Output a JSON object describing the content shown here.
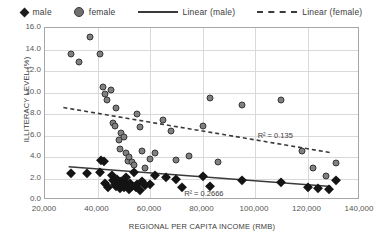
{
  "chart_data": {
    "type": "scatter",
    "title": "",
    "xlabel": "REGIONAL PER CAPITA INCOME (RMB)",
    "ylabel": "ILLITERACY LEVEL (%)",
    "xlim": [
      20000,
      140000
    ],
    "ylim": [
      0.0,
      16.0
    ],
    "xticks": [
      "20,000",
      "40,000",
      "60,000",
      "80,000",
      "100,000",
      "120,000",
      "140,000"
    ],
    "xtick_values": [
      20000,
      40000,
      60000,
      80000,
      100000,
      120000,
      140000
    ],
    "yticks": [
      "0.0",
      "2.0",
      "4.0",
      "6.0",
      "8.0",
      "10.0",
      "12.0",
      "14.0",
      "16.0"
    ],
    "ytick_values": [
      0,
      2,
      4,
      6,
      8,
      10,
      12,
      14,
      16
    ],
    "grid": "both",
    "legend_position": "top",
    "legend": [
      {
        "label": "male",
        "marker": "diamond",
        "color": "#141414"
      },
      {
        "label": "female",
        "marker": "circle",
        "color": "#808080"
      },
      {
        "label": "Linear (male)",
        "marker": "solid-line",
        "color": "#3a3a3a"
      },
      {
        "label": "Linear (female)",
        "marker": "dashed-line",
        "color": "#3a3a3a"
      }
    ],
    "series": [
      {
        "name": "male",
        "marker": "diamond",
        "points": [
          [
            30000,
            2.5
          ],
          [
            36000,
            2.5
          ],
          [
            41000,
            2.6
          ],
          [
            41500,
            3.7
          ],
          [
            42500,
            3.6
          ],
          [
            43000,
            1.6
          ],
          [
            44000,
            1.2
          ],
          [
            45500,
            2.3
          ],
          [
            46000,
            1.9
          ],
          [
            46500,
            1.5
          ],
          [
            47000,
            1.3
          ],
          [
            47500,
            2.0
          ],
          [
            48000,
            1.4
          ],
          [
            48500,
            1.1
          ],
          [
            49000,
            1.8
          ],
          [
            49500,
            1.5
          ],
          [
            50000,
            1.2
          ],
          [
            50500,
            1.7
          ],
          [
            51000,
            2.1
          ],
          [
            51500,
            1.4
          ],
          [
            52000,
            1.0
          ],
          [
            52500,
            1.6
          ],
          [
            53000,
            1.3
          ],
          [
            54000,
            2.6
          ],
          [
            54500,
            1.2
          ],
          [
            55000,
            1.5
          ],
          [
            56000,
            0.9
          ],
          [
            57000,
            1.8
          ],
          [
            58000,
            1.4
          ],
          [
            60000,
            1.5
          ],
          [
            62000,
            2.3
          ],
          [
            66000,
            2.1
          ],
          [
            70000,
            2.0
          ],
          [
            72000,
            1.2
          ],
          [
            80000,
            2.2
          ],
          [
            83000,
            1.3
          ],
          [
            95000,
            1.9
          ],
          [
            110000,
            1.7
          ],
          [
            120000,
            1.2
          ],
          [
            124000,
            1.1
          ],
          [
            128000,
            1.0
          ],
          [
            131000,
            1.9
          ]
        ]
      },
      {
        "name": "female",
        "marker": "circle",
        "points": [
          [
            30000,
            13.6
          ],
          [
            33000,
            12.8
          ],
          [
            37000,
            15.2
          ],
          [
            41000,
            13.6
          ],
          [
            42000,
            10.5
          ],
          [
            43000,
            9.9
          ],
          [
            43500,
            9.3
          ],
          [
            45000,
            10.2
          ],
          [
            46000,
            7.2
          ],
          [
            46500,
            6.9
          ],
          [
            47000,
            8.6
          ],
          [
            48000,
            5.6
          ],
          [
            48500,
            4.7
          ],
          [
            49000,
            6.2
          ],
          [
            50000,
            5.9
          ],
          [
            51000,
            4.4
          ],
          [
            51500,
            3.6
          ],
          [
            52000,
            4.0
          ],
          [
            53000,
            3.5
          ],
          [
            54000,
            3.3
          ],
          [
            55000,
            8.0
          ],
          [
            56000,
            6.8
          ],
          [
            57000,
            4.6
          ],
          [
            58000,
            3.0
          ],
          [
            60000,
            3.8
          ],
          [
            62000,
            4.4
          ],
          [
            65000,
            7.4
          ],
          [
            68000,
            6.4
          ],
          [
            70000,
            3.7
          ],
          [
            75000,
            4.1
          ],
          [
            80000,
            6.9
          ],
          [
            83000,
            9.5
          ],
          [
            86000,
            3.5
          ],
          [
            95000,
            8.8
          ],
          [
            110000,
            9.3
          ],
          [
            118000,
            4.6
          ],
          [
            122000,
            3.0
          ],
          [
            127000,
            2.2
          ],
          [
            131000,
            3.4
          ]
        ]
      }
    ],
    "trendlines": [
      {
        "name": "Linear (male)",
        "style": "solid",
        "for_series": "male",
        "x_start": 29000,
        "y_start": 3.1,
        "x_end": 129000,
        "y_end": 1.25,
        "r_squared": 0.2666,
        "r_squared_label": "R² = 0.2666"
      },
      {
        "name": "Linear (female)",
        "style": "dashed",
        "for_series": "female",
        "x_start": 27000,
        "y_start": 8.6,
        "x_end": 129000,
        "y_end": 4.4,
        "r_squared": 0.135,
        "r_squared_label": "R² = 0.135"
      }
    ]
  }
}
